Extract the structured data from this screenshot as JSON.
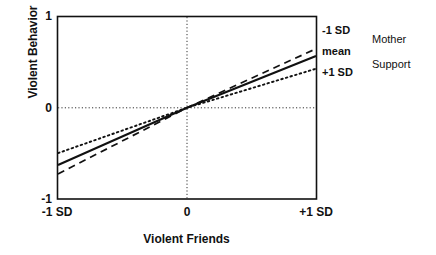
{
  "chart_data": {
    "type": "line",
    "title": "",
    "xlabel": "Violent Friends",
    "ylabel": "Violent Behavior",
    "xlim": [
      -1,
      1
    ],
    "ylim": [
      -1,
      1
    ],
    "xticks": [
      "-1 SD",
      "0",
      "+1 SD"
    ],
    "xtick_values": [
      -1,
      0,
      1
    ],
    "yticks": [
      "1",
      "0",
      "-1"
    ],
    "ytick_values": [
      1,
      0,
      -1
    ],
    "grid": "dotted reference lines at x=0 and y=0",
    "legend_position": "right",
    "legend_title": "Mother Support",
    "x": [
      -1,
      0,
      1
    ],
    "series": [
      {
        "name": "-1 SD",
        "style": "dashed",
        "values": [
          -0.73,
          0,
          0.65
        ]
      },
      {
        "name": "mean",
        "style": "solid",
        "values": [
          -0.63,
          0,
          0.57
        ]
      },
      {
        "name": "+1 SD",
        "style": "dotted",
        "values": [
          -0.5,
          0,
          0.43
        ]
      }
    ],
    "annotations": []
  },
  "axes": {
    "y_title": "Violent Behavior",
    "x_title": "Violent Friends",
    "y_tick_top": "1",
    "y_tick_mid": "0",
    "y_tick_bottom": "-1",
    "x_tick_left": "-1 SD",
    "x_tick_mid": "0",
    "x_tick_right": "+1 SD"
  },
  "legend": {
    "items": [
      {
        "label": "-1 SD"
      },
      {
        "label": "mean"
      },
      {
        "label": "+1 SD"
      }
    ],
    "title_line1": "Mother",
    "title_line2": "Support"
  },
  "colors": {
    "ink": "#111111",
    "background": "#ffffff",
    "grid": "#333333"
  }
}
